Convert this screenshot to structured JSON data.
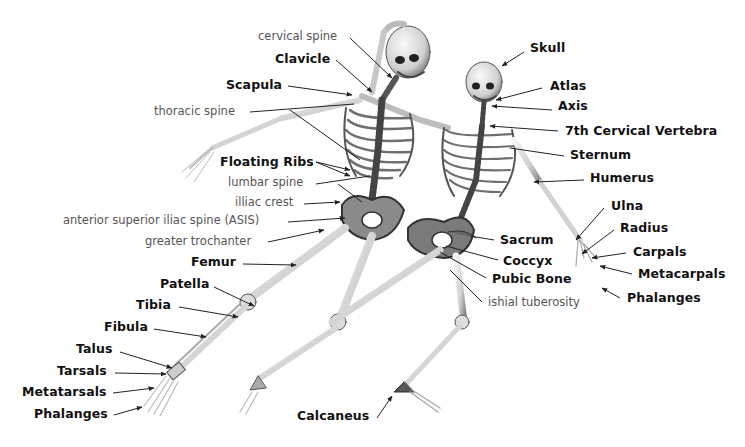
{
  "diagram": {
    "labels": [
      {
        "id": "cervical-spine",
        "text": "cervical spine",
        "style": "light",
        "x": 258,
        "y": 31
      },
      {
        "id": "clavicle",
        "text": "Clavicle",
        "style": "bold",
        "x": 275,
        "y": 53
      },
      {
        "id": "scapula",
        "text": "Scapula",
        "style": "bold",
        "x": 226,
        "y": 79
      },
      {
        "id": "thoracic-spine",
        "text": "thoracic spine",
        "style": "light",
        "x": 154,
        "y": 106
      },
      {
        "id": "floating-ribs",
        "text": "Floating Ribs",
        "style": "bold",
        "x": 220,
        "y": 156
      },
      {
        "id": "lumbar-spine",
        "text": "lumbar spine",
        "style": "light",
        "x": 228,
        "y": 177
      },
      {
        "id": "illiac-crest",
        "text": "illiac crest",
        "style": "light",
        "x": 235,
        "y": 197
      },
      {
        "id": "asis",
        "text": "anterior superior iliac spine (ASIS)",
        "style": "light",
        "x": 63,
        "y": 215
      },
      {
        "id": "greater-trochanter",
        "text": "greater trochanter",
        "style": "light",
        "x": 145,
        "y": 236
      },
      {
        "id": "femur",
        "text": "Femur",
        "style": "bold",
        "x": 191,
        "y": 256
      },
      {
        "id": "patella",
        "text": "Patella",
        "style": "bold",
        "x": 160,
        "y": 278
      },
      {
        "id": "tibia",
        "text": "Tibia",
        "style": "bold",
        "x": 136,
        "y": 299
      },
      {
        "id": "fibula",
        "text": "Fibula",
        "style": "bold",
        "x": 104,
        "y": 321
      },
      {
        "id": "talus",
        "text": "Talus",
        "style": "bold",
        "x": 76,
        "y": 343
      },
      {
        "id": "tarsals",
        "text": "Tarsals",
        "style": "bold",
        "x": 57,
        "y": 365
      },
      {
        "id": "metatarsals",
        "text": "Metatarsals",
        "style": "bold",
        "x": 22,
        "y": 386
      },
      {
        "id": "phalanges-foot",
        "text": "Phalanges",
        "style": "bold",
        "x": 34,
        "y": 408
      },
      {
        "id": "calcaneus",
        "text": "Calcaneus",
        "style": "bold",
        "x": 297,
        "y": 410
      },
      {
        "id": "skull",
        "text": "Skull",
        "style": "bold",
        "x": 530,
        "y": 42
      },
      {
        "id": "atlas",
        "text": "Atlas",
        "style": "bold",
        "x": 550,
        "y": 80
      },
      {
        "id": "axis",
        "text": "Axis",
        "style": "bold",
        "x": 558,
        "y": 100
      },
      {
        "id": "c7",
        "text": "7th Cervical Vertebra",
        "style": "bold",
        "x": 565,
        "y": 125
      },
      {
        "id": "sternum",
        "text": "Sternum",
        "style": "bold",
        "x": 570,
        "y": 149
      },
      {
        "id": "humerus",
        "text": "Humerus",
        "style": "bold",
        "x": 590,
        "y": 172
      },
      {
        "id": "ulna",
        "text": "Ulna",
        "style": "bold",
        "x": 611,
        "y": 200
      },
      {
        "id": "radius",
        "text": "Radius",
        "style": "bold",
        "x": 620,
        "y": 222
      },
      {
        "id": "sacrum",
        "text": "Sacrum",
        "style": "bold",
        "x": 500,
        "y": 234
      },
      {
        "id": "carpals",
        "text": "Carpals",
        "style": "bold",
        "x": 633,
        "y": 246
      },
      {
        "id": "coccyx",
        "text": "Coccyx",
        "style": "bold",
        "x": 503,
        "y": 255
      },
      {
        "id": "metacarpals",
        "text": "Metacarpals",
        "style": "bold",
        "x": 638,
        "y": 268
      },
      {
        "id": "pubic-bone",
        "text": "Pubic Bone",
        "style": "bold",
        "x": 492,
        "y": 273
      },
      {
        "id": "phalanges-hand",
        "text": "Phalanges",
        "style": "bold",
        "x": 627,
        "y": 292
      },
      {
        "id": "ishial-tuberosity",
        "text": "ishial tuberosity",
        "style": "light",
        "x": 488,
        "y": 297
      }
    ],
    "colors": {
      "background": "#ffffff",
      "bold_label": "#111111",
      "light_label": "#555555",
      "leader_line": "#222222",
      "bone_light": "#e6e6e6",
      "bone_mid": "#b8b8b8",
      "bone_dark": "#3a3a3a"
    }
  }
}
